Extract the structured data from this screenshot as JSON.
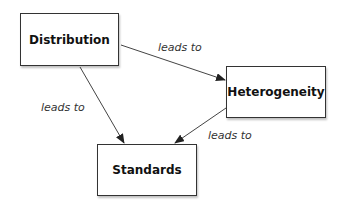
{
  "nodes": [
    {
      "id": "distribution",
      "label": "Distribution"
    },
    {
      "id": "heterogeneity",
      "label": "Heterogeneity"
    },
    {
      "id": "standards",
      "label": "Standards"
    }
  ],
  "edges": [
    {
      "from": "distribution",
      "to": "heterogeneity",
      "label": "leads to"
    },
    {
      "from": "distribution",
      "to": "standards",
      "label": "leads to"
    },
    {
      "from": "heterogeneity",
      "to": "standards",
      "label": "leads to"
    }
  ],
  "colors": {
    "stroke": "#333333",
    "background": "#ffffff"
  }
}
